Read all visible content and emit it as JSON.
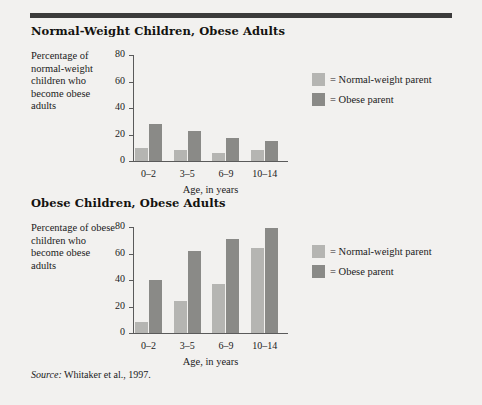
{
  "figure": {
    "source_note_prefix": "Source:",
    "source_note": "Whitaker et al., 1997.",
    "accent_rule_color": "#3b3b3b",
    "background_color": "#f2f1ef",
    "series_colors": {
      "normal_weight_parent": "#b5b5b2",
      "obese_parent": "#8a8a87"
    }
  },
  "legend": {
    "items": [
      {
        "label": "= Normal-weight parent",
        "swatch": "light"
      },
      {
        "label": "= Obese parent",
        "swatch": "dark"
      }
    ]
  },
  "chart_data": [
    {
      "type": "bar",
      "title": "Normal-Weight Children, Obese Adults",
      "ylabel": "Percentage of normal-weight children who become obese adults",
      "xlabel": "Age, in years",
      "categories": [
        "0–2",
        "3–5",
        "6–9",
        "10–14"
      ],
      "ylim": [
        0,
        80
      ],
      "yticks": [
        0,
        20,
        40,
        60,
        80
      ],
      "grid": false,
      "legend_position": "right",
      "series": [
        {
          "name": "Normal-weight parent",
          "color": "#b5b5b2",
          "values": [
            10,
            8,
            6,
            8
          ]
        },
        {
          "name": "Obese parent",
          "color": "#8a8a87",
          "values": [
            28,
            23,
            17,
            15
          ]
        }
      ]
    },
    {
      "type": "bar",
      "title": "Obese Children, Obese Adults",
      "ylabel": "Percentage of obese children who become obese adults",
      "xlabel": "Age, in years",
      "categories": [
        "0–2",
        "3–5",
        "6–9",
        "10–14"
      ],
      "ylim": [
        0,
        80
      ],
      "yticks": [
        0,
        20,
        40,
        60,
        80
      ],
      "grid": false,
      "legend_position": "right",
      "series": [
        {
          "name": "Normal-weight parent",
          "color": "#b5b5b2",
          "values": [
            8,
            24,
            37,
            64
          ]
        },
        {
          "name": "Obese parent",
          "color": "#8a8a87",
          "values": [
            40,
            62,
            71,
            79
          ]
        }
      ]
    }
  ]
}
